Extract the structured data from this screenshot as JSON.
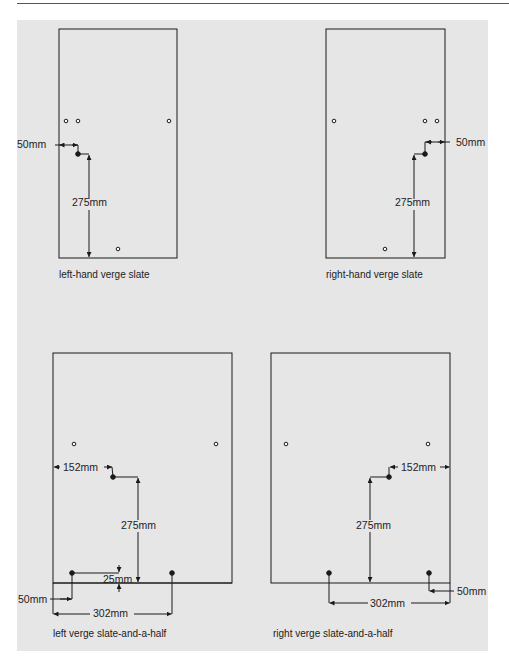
{
  "figure": {
    "type": "technical-diagram",
    "diagrams": [
      {
        "id": "left-hand-verge-slate",
        "caption": "left-hand verge slate",
        "dimensions": {
          "horizontal": "50mm",
          "vertical": "275mm"
        }
      },
      {
        "id": "right-hand-verge-slate",
        "caption": "right-hand verge slate",
        "dimensions": {
          "horizontal": "50mm",
          "vertical": "275mm"
        }
      },
      {
        "id": "left-verge-slate-and-a-half",
        "caption": "left verge slate-and-a-half",
        "dimensions": {
          "side": "152mm",
          "vertical": "275mm",
          "offset": "25mm",
          "edge": "50mm",
          "span": "302mm"
        }
      },
      {
        "id": "right-verge-slate-and-a-half",
        "caption": "right verge slate-and-a-half",
        "dimensions": {
          "side": "152mm",
          "vertical": "275mm",
          "edge": "50mm",
          "span": "302mm"
        }
      }
    ]
  },
  "colors": {
    "panel": "#e6e6e6",
    "ink": "#1a1a1a"
  }
}
